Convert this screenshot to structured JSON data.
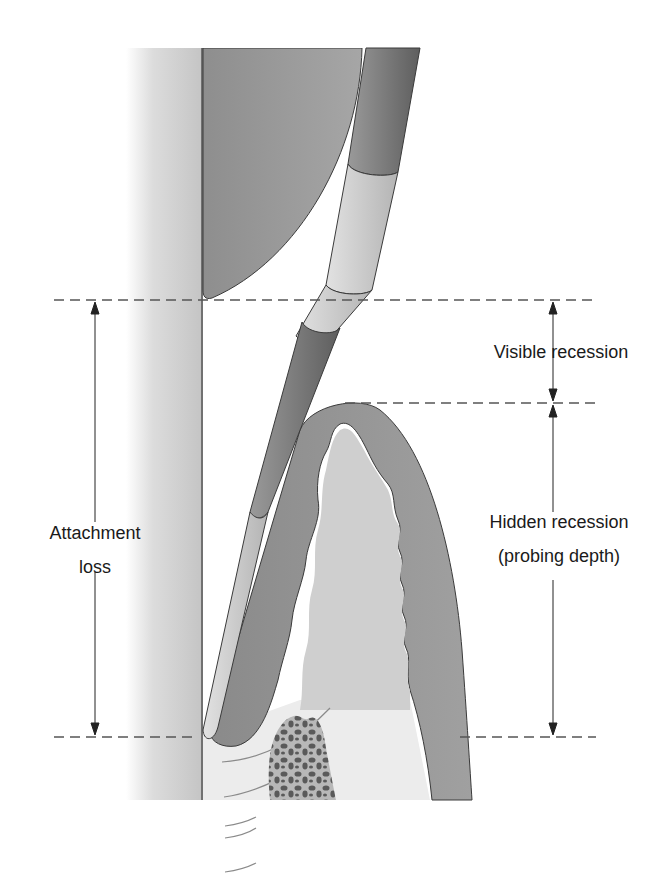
{
  "figure": {
    "labels": {
      "visible_recession": "Visible recession",
      "hidden_recession_line1": "Hidden recession",
      "hidden_recession_line2": "(probing depth)",
      "attachment_loss_line1": "Attachment",
      "attachment_loss_line2": "loss"
    },
    "reference_lines_y": [
      300,
      403,
      737
    ],
    "colors": {
      "tooth_light": "#f4f4f4",
      "tooth_dark": "#c8c8c8",
      "tissue": "#8c8c8c",
      "probe_dark": "#707070",
      "probe_light": "#d6d6d6",
      "bone_fill": "#bdbdbd",
      "bone_dots": "#5a5a5a",
      "outline": "#3a3a3a"
    }
  }
}
